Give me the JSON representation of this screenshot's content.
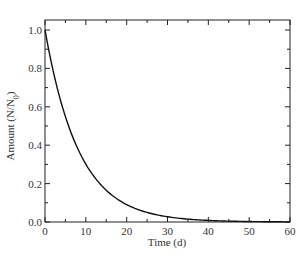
{
  "chart_data": {
    "type": "line",
    "title": "",
    "xlabel": "Time (d)",
    "ylabel": "Amount (N/N0)",
    "ylabel_parts": {
      "main": "Amount (N/N",
      "sub": "0",
      "end": ")"
    },
    "xlim": [
      0,
      60
    ],
    "ylim": [
      0,
      1.0
    ],
    "xticks": [
      0,
      10,
      20,
      30,
      40,
      50,
      60
    ],
    "xtick_labels": [
      "0",
      "10",
      "20",
      "30",
      "40",
      "50",
      "60"
    ],
    "yticks": [
      0.0,
      0.2,
      0.4,
      0.6,
      0.8,
      1.0
    ],
    "ytick_labels": [
      "0.0",
      "0.2",
      "0.4",
      "0.6",
      "0.8",
      "1.0"
    ],
    "grid": false,
    "legend": null,
    "series": [
      {
        "name": "exponential decay",
        "model": "N/N0 = exp(-0.12 t)",
        "x": [
          0,
          5,
          10,
          15,
          20,
          25,
          30,
          35,
          40,
          45,
          50,
          55,
          60
        ],
        "values": [
          1.0,
          0.55,
          0.3,
          0.165,
          0.09,
          0.05,
          0.027,
          0.015,
          0.008,
          0.0045,
          0.0025,
          0.0014,
          0.0007
        ]
      }
    ]
  }
}
